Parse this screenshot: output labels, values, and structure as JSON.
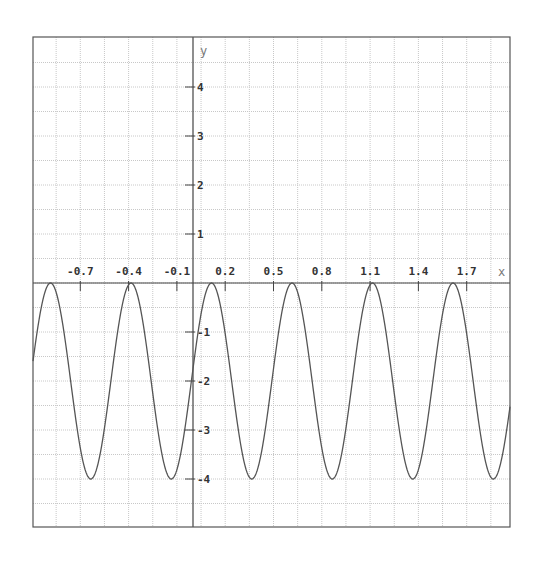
{
  "chart_data": {
    "type": "line",
    "title": "",
    "xlabel": "x",
    "ylabel": "y",
    "xlim": [
      -0.995,
      1.87
    ],
    "ylim": [
      -5.0,
      5.0
    ],
    "grid": true,
    "legend": null,
    "x_ticks": [
      -0.7,
      -0.4,
      -0.1,
      0.2,
      0.5,
      0.8,
      1.1,
      1.4,
      1.7
    ],
    "x_tick_labels": [
      "-0.7",
      "-0.4",
      "-0.1",
      "0.2",
      "0.5",
      "0.8",
      "1.1",
      "1.4",
      "1.7"
    ],
    "y_ticks": [
      4,
      3,
      2,
      1,
      -1,
      -2,
      -3,
      -4
    ],
    "y_tick_labels": [
      "4",
      "3",
      "2",
      "1",
      "-1",
      "-2",
      "-3",
      "-4"
    ],
    "x_grid_step": 0.15,
    "y_grid_step": 0.5,
    "series": [
      {
        "name": "y = -2 + 2·cos(4π(x - 0.115))",
        "function": {
          "offset": -2,
          "amplitude": 2,
          "period": 0.5,
          "phase_x": 0.115
        },
        "maxima": [
          [
            -0.885,
            0
          ],
          [
            -0.385,
            0
          ],
          [
            0.115,
            0
          ],
          [
            0.615,
            0
          ],
          [
            1.115,
            0
          ],
          [
            1.615,
            0
          ]
        ],
        "minima": [
          [
            -0.635,
            -4
          ],
          [
            -0.135,
            -4
          ],
          [
            0.365,
            -4
          ],
          [
            0.865,
            -4
          ],
          [
            1.365,
            -4
          ],
          [
            1.865,
            -4
          ]
        ],
        "color": "#555555"
      }
    ]
  },
  "style": {
    "frame_color": "#555555",
    "axis_color": "#444444",
    "grid_color": "#c8c8c8",
    "curve_color": "#555555"
  }
}
